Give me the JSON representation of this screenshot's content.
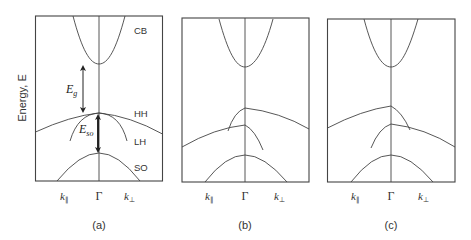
{
  "figure": {
    "y_axis_label": "Energy, E",
    "panels": [
      {
        "id": "a",
        "caption": "(a)",
        "x_labels": {
          "k_parallel": "k",
          "k_parallel_sub": "∥",
          "gamma": "Γ",
          "k_perp": "k",
          "k_perp_sub": "⊥"
        },
        "band_labels": {
          "cb": "CB",
          "hh": "HH",
          "lh": "LH",
          "so": "SO"
        },
        "annotations": {
          "eg": "E",
          "eg_sub": "g",
          "eso": "E",
          "eso_sub": "so"
        }
      },
      {
        "id": "b",
        "caption": "(b)",
        "x_labels": {
          "k_parallel": "k",
          "k_parallel_sub": "∥",
          "gamma": "Γ",
          "k_perp": "k",
          "k_perp_sub": "⊥"
        }
      },
      {
        "id": "c",
        "caption": "(c)",
        "x_labels": {
          "k_parallel": "k",
          "k_parallel_sub": "∥",
          "gamma": "Γ",
          "k_perp": "k",
          "k_perp_sub": "⊥"
        }
      }
    ],
    "colors": {
      "line": "#444444",
      "text": "#333333",
      "background": "#ffffff"
    }
  }
}
